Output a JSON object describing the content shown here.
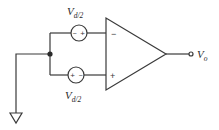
{
  "diagram": {
    "type": "op-amp circuit",
    "colors": {
      "line": "#3a3a3a",
      "text": "#2a2a2a",
      "background": "#ffffff"
    },
    "sources": [
      {
        "id": "top-source",
        "label_main": "V",
        "label_sub": "d/2",
        "polarity": {
          "left": "−",
          "right": "+"
        }
      },
      {
        "id": "bottom-source",
        "label_main": "V",
        "label_sub": "d/2",
        "polarity": {
          "left": "+",
          "right": "−"
        }
      }
    ],
    "opamp": {
      "inverting_sign": "−",
      "noninverting_sign": "+"
    },
    "output": {
      "label_main": "V",
      "label_sub": "o"
    },
    "ground": {
      "symbol": "ground-triangle"
    }
  }
}
